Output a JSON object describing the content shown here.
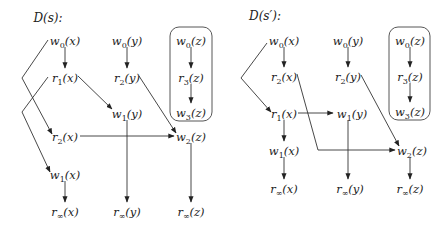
{
  "diagrams": [
    {
      "id": "D-s",
      "title": "D(s):",
      "title_pos": [
        48,
        22
      ],
      "nodes": [
        {
          "id": "w0x",
          "op": "w",
          "sub": "0",
          "var": "x",
          "x": 65,
          "y": 41
        },
        {
          "id": "r1x",
          "op": "r",
          "sub": "1",
          "var": "x",
          "x": 65,
          "y": 78
        },
        {
          "id": "r2x",
          "op": "r",
          "sub": "2",
          "var": "x",
          "x": 65,
          "y": 137
        },
        {
          "id": "w1x",
          "op": "w",
          "sub": "1",
          "var": "x",
          "x": 65,
          "y": 175
        },
        {
          "id": "rinfx",
          "op": "r",
          "sub": "∞",
          "var": "x",
          "x": 65,
          "y": 212
        },
        {
          "id": "w0y",
          "op": "w",
          "sub": "0",
          "var": "y",
          "x": 127,
          "y": 41
        },
        {
          "id": "r2y",
          "op": "r",
          "sub": "2",
          "var": "y",
          "x": 127,
          "y": 78
        },
        {
          "id": "w1y",
          "op": "w",
          "sub": "1",
          "var": "y",
          "x": 127,
          "y": 114
        },
        {
          "id": "rinfy",
          "op": "r",
          "sub": "∞",
          "var": "y",
          "x": 127,
          "y": 212
        },
        {
          "id": "w0z",
          "op": "w",
          "sub": "0",
          "var": "z",
          "x": 191,
          "y": 41
        },
        {
          "id": "r3z",
          "op": "r",
          "sub": "3",
          "var": "z",
          "x": 191,
          "y": 78
        },
        {
          "id": "w3z",
          "op": "w",
          "sub": "3",
          "var": "z",
          "x": 191,
          "y": 113
        },
        {
          "id": "w2z",
          "op": "w",
          "sub": "2",
          "var": "z",
          "x": 191,
          "y": 137
        },
        {
          "id": "rinfz",
          "op": "r",
          "sub": "∞",
          "var": "z",
          "x": 191,
          "y": 212
        }
      ],
      "group_box": {
        "x": 170,
        "y": 27,
        "w": 42,
        "h": 94,
        "r": 9
      },
      "edges": [
        {
          "from": "w0x",
          "to": "r1x",
          "points": [
            [
              65,
              47
            ],
            [
              65,
              68
            ]
          ]
        },
        {
          "from": "w0y",
          "to": "r2y",
          "points": [
            [
              127,
              47
            ],
            [
              127,
              68
            ]
          ]
        },
        {
          "from": "w0z",
          "to": "r3z",
          "points": [
            [
              191,
              47
            ],
            [
              191,
              68
            ]
          ]
        },
        {
          "from": "r3z",
          "to": "w3z",
          "points": [
            [
              191,
              84
            ],
            [
              191,
              103
            ]
          ]
        },
        {
          "from": "w0x",
          "to": "r2x",
          "points": [
            [
              48,
              40
            ],
            [
              22,
              78
            ],
            [
              52,
              134
            ]
          ]
        },
        {
          "from": "r1x",
          "to": "w1x",
          "points": [
            [
              48,
              77
            ],
            [
              22,
              112
            ],
            [
              50,
              172
            ]
          ]
        },
        {
          "from": "r1x",
          "to": "w1y",
          "points": [
            [
              78,
              76
            ],
            [
              112,
              109
            ]
          ]
        },
        {
          "from": "r2y",
          "to": "w2z",
          "points": [
            [
              139,
              76
            ],
            [
              176,
              133
            ]
          ]
        },
        {
          "from": "r2x",
          "to": "w2z",
          "points": [
            [
              80,
              136
            ],
            [
              174,
              136
            ]
          ]
        },
        {
          "from": "w1x",
          "to": "rinfx",
          "points": [
            [
              65,
              181
            ],
            [
              65,
              202
            ]
          ]
        },
        {
          "from": "w1y",
          "to": "rinfy",
          "points": [
            [
              127,
              120
            ],
            [
              127,
              202
            ]
          ]
        },
        {
          "from": "w2z",
          "to": "rinfz",
          "points": [
            [
              191,
              143
            ],
            [
              191,
              202
            ]
          ]
        }
      ]
    },
    {
      "id": "D-s-prime",
      "title": "D(s′):",
      "title_pos": [
        265,
        20
      ],
      "nodes": [
        {
          "id": "w0x",
          "op": "w",
          "sub": "0",
          "var": "x",
          "x": 284,
          "y": 41
        },
        {
          "id": "r2x",
          "op": "r",
          "sub": "2",
          "var": "x",
          "x": 284,
          "y": 77
        },
        {
          "id": "r1x",
          "op": "r",
          "sub": "1",
          "var": "x",
          "x": 284,
          "y": 114
        },
        {
          "id": "w1x",
          "op": "w",
          "sub": "1",
          "var": "x",
          "x": 284,
          "y": 151
        },
        {
          "id": "rinfx",
          "op": "r",
          "sub": "∞",
          "var": "x",
          "x": 284,
          "y": 189
        },
        {
          "id": "w0y",
          "op": "w",
          "sub": "0",
          "var": "y",
          "x": 348,
          "y": 41
        },
        {
          "id": "r2y",
          "op": "r",
          "sub": "2",
          "var": "y",
          "x": 348,
          "y": 77
        },
        {
          "id": "w1y",
          "op": "w",
          "sub": "1",
          "var": "y",
          "x": 352,
          "y": 114
        },
        {
          "id": "rinfy",
          "op": "r",
          "sub": "∞",
          "var": "y",
          "x": 350,
          "y": 189
        },
        {
          "id": "w0z",
          "op": "w",
          "sub": "0",
          "var": "z",
          "x": 410,
          "y": 41
        },
        {
          "id": "r3z",
          "op": "r",
          "sub": "3",
          "var": "z",
          "x": 410,
          "y": 77
        },
        {
          "id": "w3z",
          "op": "w",
          "sub": "3",
          "var": "z",
          "x": 410,
          "y": 112
        },
        {
          "id": "w2z",
          "op": "w",
          "sub": "2",
          "var": "z",
          "x": 412,
          "y": 151
        },
        {
          "id": "rinfz",
          "op": "r",
          "sub": "∞",
          "var": "z",
          "x": 410,
          "y": 189
        }
      ],
      "group_box": {
        "x": 389,
        "y": 27,
        "w": 41,
        "h": 93,
        "r": 9
      },
      "edges": [
        {
          "from": "w0x",
          "to": "r2x",
          "points": [
            [
              284,
              47
            ],
            [
              284,
              67
            ]
          ]
        },
        {
          "from": "w0y",
          "to": "r2y",
          "points": [
            [
              348,
              47
            ],
            [
              348,
              67
            ]
          ]
        },
        {
          "from": "w0z",
          "to": "r3z",
          "points": [
            [
              410,
              47
            ],
            [
              410,
              67
            ]
          ]
        },
        {
          "from": "r3z",
          "to": "w3z",
          "points": [
            [
              410,
              83
            ],
            [
              410,
              102
            ]
          ]
        },
        {
          "from": "w0x",
          "to": "r1x",
          "points": [
            [
              267,
              43
            ],
            [
              241,
              78
            ],
            [
              271,
              112
            ]
          ]
        },
        {
          "from": "r1x",
          "to": "w1y",
          "points": [
            [
              298,
              113
            ],
            [
              333,
              113
            ]
          ]
        },
        {
          "from": "r1x",
          "to": "w1x",
          "points": [
            [
              284,
              120
            ],
            [
              284,
              141
            ]
          ]
        },
        {
          "from": "r2x",
          "to": "w2z",
          "points": [
            [
              297,
              74
            ],
            [
              318,
              150
            ],
            [
              395,
              150
            ]
          ]
        },
        {
          "from": "r2y",
          "to": "w2z",
          "points": [
            [
              361,
              75
            ],
            [
              399,
              146
            ]
          ]
        },
        {
          "from": "w1x",
          "to": "rinfx",
          "points": [
            [
              284,
              157
            ],
            [
              284,
              179
            ]
          ]
        },
        {
          "from": "w1y",
          "to": "rinfy",
          "points": [
            [
              348,
              120
            ],
            [
              348,
              179
            ]
          ]
        },
        {
          "from": "w2z",
          "to": "rinfz",
          "points": [
            [
              410,
              157
            ],
            [
              410,
              179
            ]
          ]
        }
      ]
    }
  ],
  "footer_rule": {
    "x1": 240,
    "x2": 430,
    "y": 232
  }
}
